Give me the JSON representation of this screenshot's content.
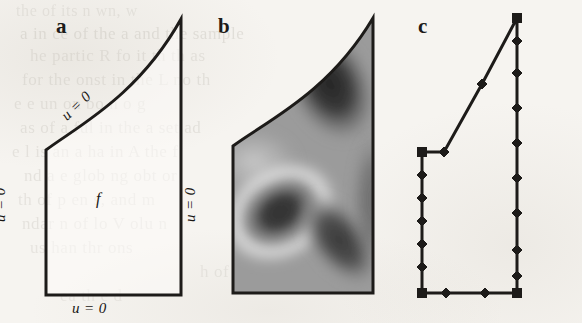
{
  "figure": {
    "kind": "three-panel scientific figure",
    "background_color": "#f6f4f0",
    "ink_color": "#1d1b19",
    "panels": [
      {
        "id": "a",
        "label": "a",
        "caption_role": "domain with boundary conditions",
        "interior_label": "f",
        "boundary_labels": {
          "left": "u = 0",
          "right": "u = 0",
          "bottom": "u = 0",
          "curve": "u = 0"
        }
      },
      {
        "id": "b",
        "label": "b",
        "caption_role": "grayscale solution heatmap on the domain"
      },
      {
        "id": "c",
        "label": "c",
        "caption_role": "discretized boundary with node markers"
      }
    ]
  },
  "panel_a": {
    "label": "a",
    "interior_label": "f",
    "bc_left": "u = 0",
    "bc_right": "u = 0",
    "bc_bottom": "u = 0",
    "bc_curve": "u = 0",
    "outline_color": "#1d1b19",
    "outline_width": 3,
    "geometry": {
      "left_x": 46,
      "right_x": 181,
      "bottom_y": 295,
      "left_top_y": 150,
      "right_top_y": 19,
      "curve_control_1": [
        78,
        126
      ],
      "curve_control_2": [
        138,
        96
      ]
    }
  },
  "panel_b": {
    "label": "b",
    "outline_color": "#1d1b19",
    "outline_width": 3,
    "geometry": {
      "left_x": 37,
      "right_x": 177,
      "bottom_y": 293,
      "left_top_y": 146,
      "right_top_y": 18,
      "curve_control_1": [
        69,
        122
      ],
      "curve_control_2": [
        132,
        94
      ]
    },
    "field": {
      "colormap": "grayscale",
      "background_level": "#9a9a9a",
      "features": [
        {
          "name": "dark-ellipse-blob",
          "cx": 84,
          "cy": 212,
          "rx": 38,
          "ry": 28,
          "rotation_deg": -32,
          "level": "#3a3a3a"
        },
        {
          "name": "light-ring",
          "cx": 84,
          "cy": 212,
          "rx": 58,
          "ry": 46,
          "rotation_deg": -32,
          "level": "#dcdcdc"
        },
        {
          "name": "dark-diagonal-band",
          "cx": 140,
          "cy": 238,
          "rx": 30,
          "ry": 52,
          "rotation_deg": -38,
          "level": "#3f3f3f"
        },
        {
          "name": "dark-upper-curve-band",
          "cx": 132,
          "cy": 86,
          "rx": 40,
          "ry": 58,
          "rotation_deg": -26,
          "level": "#2e2e2e"
        },
        {
          "name": "light-upper-left",
          "cx": 58,
          "cy": 160,
          "rx": 40,
          "ry": 30,
          "rotation_deg": 0,
          "level": "#c8c8c8"
        }
      ]
    }
  },
  "panel_c": {
    "label": "c",
    "outline_color": "#1d1b19",
    "outline_width": 3,
    "node_marker": "diamond",
    "node_color": "#1d1b19",
    "geometry": {
      "left_x": 40,
      "right_x": 135,
      "bottom_y": 293,
      "left_top_y": 152,
      "right_top_y": 18,
      "curve_vertex_1": [
        62,
        152
      ],
      "curve_vertex_2": [
        100,
        84
      ]
    },
    "corner_nodes": [
      [
        40,
        152
      ],
      [
        40,
        293
      ],
      [
        135,
        293
      ],
      [
        135,
        18
      ]
    ],
    "edge_nodes": {
      "left": [
        [
          40,
          175
        ],
        [
          40,
          198
        ],
        [
          40,
          221
        ],
        [
          40,
          244
        ],
        [
          40,
          267
        ]
      ],
      "bottom": [
        [
          64,
          293
        ],
        [
          103,
          293
        ]
      ],
      "right": [
        [
          135,
          41
        ],
        [
          135,
          73
        ],
        [
          135,
          108
        ],
        [
          135,
          143
        ],
        [
          135,
          178
        ],
        [
          135,
          213
        ],
        [
          135,
          250
        ],
        [
          135,
          276
        ]
      ],
      "polyline": [
        [
          62,
          152
        ],
        [
          100,
          84
        ]
      ]
    }
  },
  "ghost_text": {
    "note": "faint show-through text from the reverse side of the scanned page",
    "lines": [
      {
        "text": "the  of  its  n  wn,  w",
        "x": 16,
        "y": 2,
        "size": 16,
        "opacity": 0.55
      },
      {
        "text": "a  in  ce  of  the  a  and  the  sample",
        "x": 20,
        "y": 24,
        "size": 17,
        "opacity": 0.7
      },
      {
        "text": "he  partic  R  fo  it  th  th  as",
        "x": 30,
        "y": 46,
        "size": 17,
        "opacity": 0.6
      },
      {
        "text": "for  the  onst  in  the  L  no  th",
        "x": 22,
        "y": 70,
        "size": 17,
        "opacity": 0.62
      },
      {
        "text": "e  e  un  on  bo  n  o  g",
        "x": 14,
        "y": 94,
        "size": 17,
        "opacity": 0.6
      },
      {
        "text": "as  of  a  ful  in  the  a  set  ad",
        "x": 20,
        "y": 118,
        "size": 17,
        "opacity": 0.62
      },
      {
        "text": "e  l  is  an  a  ha  in  A  the  f",
        "x": 12,
        "y": 142,
        "size": 17,
        "opacity": 0.6
      },
      {
        "text": "nd  a  e  glob  ng  obt  or",
        "x": 24,
        "y": 166,
        "size": 17,
        "opacity": 0.6
      },
      {
        "text": "th  of  p  en  s,  and  m",
        "x": 18,
        "y": 190,
        "size": 17,
        "opacity": 0.58
      },
      {
        "text": "ndar  n  of  lo  V  olu  n",
        "x": 22,
        "y": 214,
        "size": 17,
        "opacity": 0.6
      },
      {
        "text": "us  han  thr  ons",
        "x": 30,
        "y": 238,
        "size": 17,
        "opacity": 0.55
      },
      {
        "text": "h  of  fin  nt  m",
        "x": 200,
        "y": 262,
        "size": 17,
        "opacity": 0.5
      },
      {
        "text": "ea  th  e  d",
        "x": 60,
        "y": 286,
        "size": 17,
        "opacity": 0.45
      }
    ]
  }
}
